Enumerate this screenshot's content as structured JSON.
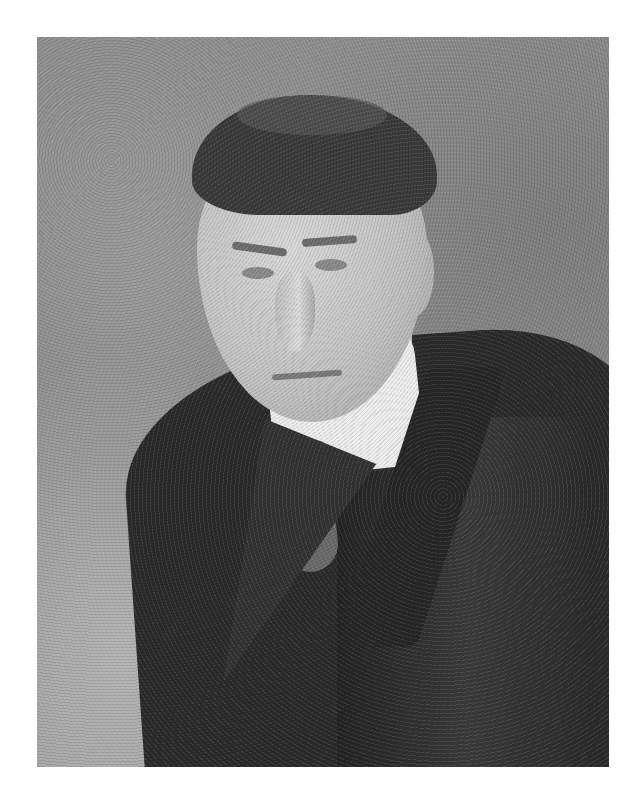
{
  "image": {
    "type": "photograph",
    "description": "Black-and-white studio portrait of a middle-aged man with short dark parted hair, wearing a dark suit jacket, white high collar, and a light patterned tie, against a mottled gray backdrop",
    "frame": {
      "left": 37,
      "top": 37,
      "width": 572,
      "height": 730
    },
    "colors": {
      "page_background": "#ffffff",
      "backdrop": "#8e8e8e",
      "coat": "#2b2b2b",
      "collar": "#ececec",
      "skin": "#c8c8c8",
      "hair": "#3a3a3a"
    }
  }
}
